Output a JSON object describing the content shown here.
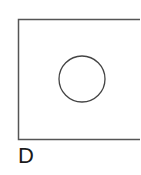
{
  "figure": {
    "label": "D",
    "rectangle": {
      "x": 18.5,
      "y": 19.5,
      "width": 130,
      "height": 120,
      "stroke": "#555555",
      "stroke_width": 1.5
    },
    "circle": {
      "cx": 82,
      "cy": 79,
      "r": 23,
      "stroke": "#444444",
      "stroke_width": 1.3
    }
  }
}
